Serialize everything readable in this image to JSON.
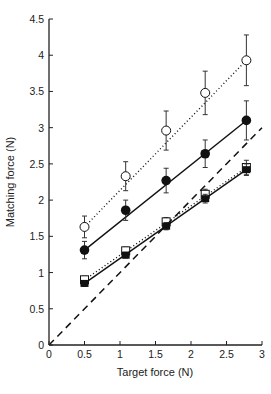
{
  "chart_data": {
    "type": "line",
    "title": "",
    "xlabel": "Target force (N)",
    "ylabel": "Matching force (N)",
    "xlim": [
      0,
      3
    ],
    "ylim": [
      0,
      4.5
    ],
    "xticks": [
      "0",
      "0.5",
      "1",
      "1.5",
      "2",
      "2.5",
      "3"
    ],
    "yticks": [
      "0",
      "0.5",
      "1",
      "1.5",
      "2",
      "2.5",
      "3",
      "3.5",
      "4",
      "4.5"
    ],
    "grid": false,
    "legend": "none",
    "x": [
      0.5,
      1.08,
      1.65,
      2.2,
      2.78
    ],
    "series": [
      {
        "name": "open circles (dotted)",
        "marker": "open-circle",
        "line": "dotted",
        "values": [
          1.63,
          2.33,
          2.96,
          3.48,
          3.93
        ],
        "err": [
          0.15,
          0.2,
          0.27,
          0.3,
          0.35
        ]
      },
      {
        "name": "filled circles (solid)",
        "marker": "filled-circle",
        "line": "solid",
        "values": [
          1.31,
          1.86,
          2.27,
          2.64,
          3.1
        ],
        "err": [
          0.12,
          0.14,
          0.17,
          0.19,
          0.27
        ]
      },
      {
        "name": "open squares (dotted)",
        "marker": "open-square",
        "line": "dotted",
        "values": [
          0.9,
          1.3,
          1.7,
          2.08,
          2.45
        ],
        "err": [
          0.05,
          0.05,
          0.06,
          0.07,
          0.1
        ]
      },
      {
        "name": "filled squares (solid)",
        "marker": "filled-square",
        "line": "solid",
        "values": [
          0.85,
          1.24,
          1.64,
          2.02,
          2.42
        ],
        "err": [
          0.04,
          0.04,
          0.05,
          0.06,
          0.08
        ]
      },
      {
        "name": "identity (dashed)",
        "marker": "none",
        "line": "dashed",
        "x": [
          0,
          3
        ],
        "values": [
          0,
          3
        ]
      }
    ]
  }
}
